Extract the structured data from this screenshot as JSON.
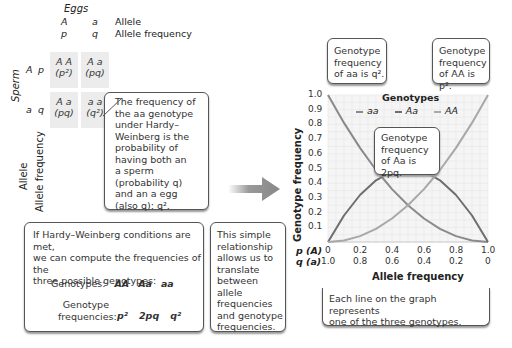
{
  "punnett": {
    "eggs_label": "Eggs",
    "sperm_label": "Sperm",
    "col_alleles": [
      "A",
      "a"
    ],
    "col_freqs": [
      "p",
      "q"
    ],
    "row_alleles": [
      "A",
      "a"
    ],
    "row_freqs": [
      "p",
      "q"
    ],
    "allele_label": "Allele",
    "allele_freq_label": "Allele frequency",
    "side_allele_label": "Allele",
    "side_allele_freq_label": "Allele frequency",
    "cells": [
      {
        "genotype": "A A",
        "freq": "(p²)"
      },
      {
        "genotype": "A a",
        "freq": "(pq)"
      },
      {
        "genotype": "A a",
        "freq": "(pq)"
      },
      {
        "genotype": "a a",
        "freq": "(q²)"
      }
    ]
  },
  "callouts": {
    "aa_freq": [
      "The frequency of",
      "the aa genotype",
      "under Hardy–",
      "Weinberg is the",
      "probability of",
      "having both an",
      "a sperm",
      "(probability q)",
      "and an a egg",
      "(also q): q²."
    ],
    "hw_conditions": [
      "If Hardy–Weinberg conditions are met,",
      "we can compute the frequencies of the",
      "three possible genotypes:"
    ],
    "genotypes_label": "Genotypes:",
    "genotypes": [
      "AA",
      "Aa",
      "aa"
    ],
    "genotype_freq_label_1": "Genotype",
    "genotype_freq_label_2": "frequencies:",
    "genotype_freqs": [
      "p²",
      "2pq",
      "q²"
    ],
    "translate": [
      "This simple",
      "relationship",
      "allows us to",
      "translate",
      "between allele",
      "frequencies",
      "and genotype",
      "frequencies."
    ],
    "aa_curve": [
      "Genotype",
      "frequency",
      "of aa is q²."
    ],
    "AA_curve": [
      "Genotype",
      "frequency",
      "of AA is p²."
    ],
    "Aa_curve": [
      "Genotype",
      "frequency",
      "of Aa is 2pq."
    ],
    "each_line": [
      "Each line on the graph represents",
      "one of the three genotypes."
    ]
  },
  "chart_data": {
    "type": "line",
    "title": "",
    "xlabel": "Allele frequency",
    "ylabel": "Genotype frequency",
    "x_rows": [
      {
        "label": "p (A)",
        "ticks": [
          "0",
          "0.2",
          "0.4",
          "0.6",
          "0.8",
          "1.0"
        ]
      },
      {
        "label": "q (a)",
        "ticks": [
          "1.0",
          "0.8",
          "0.6",
          "0.4",
          "0.2",
          "0"
        ]
      }
    ],
    "y_ticks": [
      "0.1",
      "0.2",
      "0.3",
      "0.4",
      "0.5",
      "0.6",
      "0.7",
      "0.8",
      "0.9",
      "1.0"
    ],
    "xlim": [
      0,
      1
    ],
    "ylim": [
      0,
      1
    ],
    "grid": true,
    "legend_title": "Genotypes",
    "legend_position": "top",
    "x": [
      0,
      0.1,
      0.2,
      0.3,
      0.4,
      0.5,
      0.6,
      0.7,
      0.8,
      0.9,
      1.0
    ],
    "series": [
      {
        "name": "aa",
        "values": [
          1.0,
          0.81,
          0.64,
          0.49,
          0.36,
          0.25,
          0.16,
          0.09,
          0.04,
          0.01,
          0.0
        ],
        "color": "#8a8a8a"
      },
      {
        "name": "Aa",
        "values": [
          0.0,
          0.18,
          0.32,
          0.42,
          0.48,
          0.5,
          0.48,
          0.42,
          0.32,
          0.18,
          0.0
        ],
        "color": "#6e6e6e"
      },
      {
        "name": "AA",
        "values": [
          0.0,
          0.01,
          0.04,
          0.09,
          0.16,
          0.25,
          0.36,
          0.49,
          0.64,
          0.81,
          1.0
        ],
        "color": "#a8a8a8"
      }
    ]
  }
}
